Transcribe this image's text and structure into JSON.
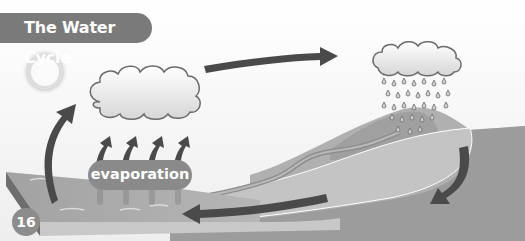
{
  "diagram": {
    "title": "The Water Cycle",
    "page_number": "16",
    "labels": {
      "evaporation": "evaporation"
    },
    "elements": [
      {
        "name": "sun",
        "icon": "sun-icon"
      },
      {
        "name": "evaporation-cloud",
        "icon": "cloud-icon"
      },
      {
        "name": "rain-cloud",
        "icon": "rain-cloud-icon"
      },
      {
        "name": "mountain",
        "icon": "hill-shape"
      },
      {
        "name": "river",
        "icon": "river-shape"
      },
      {
        "name": "sea",
        "icon": "water-shape"
      }
    ],
    "arrows": [
      {
        "from": "sea",
        "to": "evaporation-cloud",
        "meaning": "water vapour rises"
      },
      {
        "from": "evaporation-cloud",
        "to": "rain-cloud",
        "meaning": "clouds move"
      },
      {
        "from": "rain-cloud",
        "to": "land",
        "meaning": "precipitation / runoff"
      },
      {
        "from": "river",
        "to": "sea",
        "meaning": "water returns to sea"
      }
    ],
    "colors": {
      "title_bg": "#7a7a7a",
      "arrow": "#4a4a4a",
      "water": "#a8a8a8",
      "land": "#9a9a9a"
    }
  }
}
